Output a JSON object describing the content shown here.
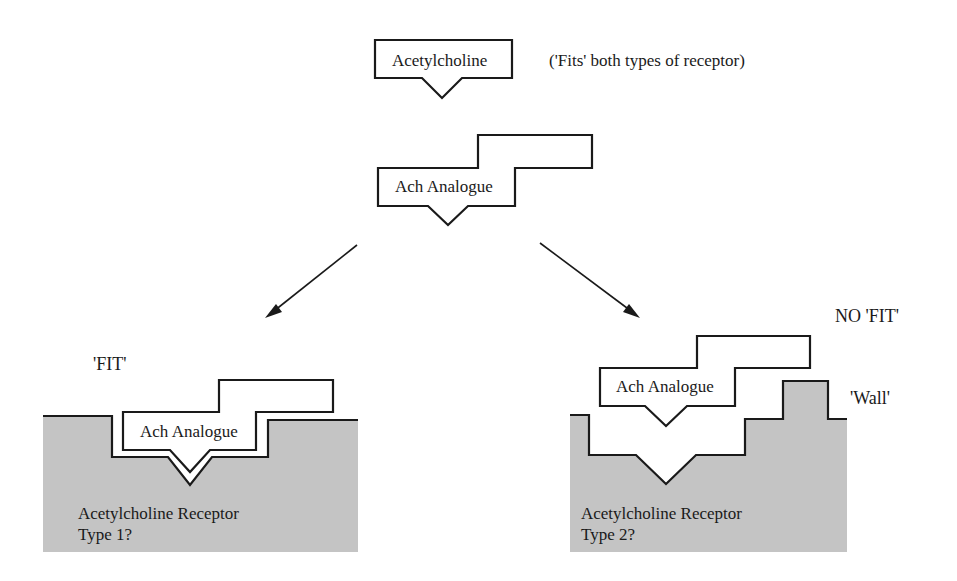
{
  "figure": {
    "top": {
      "molecule_label": "Acetylcholine",
      "note": "('Fits' both types of receptor)",
      "analogue_label": "Ach Analogue"
    },
    "left_panel": {
      "status_label": "'FIT'",
      "analogue_label": "Ach Analogue",
      "receptor_label_line1": "Acetylcholine Receptor",
      "receptor_label_line2": "Type 1?"
    },
    "right_panel": {
      "status_label": "NO 'FIT'",
      "wall_label": "'Wall'",
      "analogue_label": "Ach Analogue",
      "receptor_label_line1": "Acetylcholine Receptor",
      "receptor_label_line2": "Type 2?"
    },
    "colors": {
      "receptor_fill": "#c4c4c4",
      "outline": "#1a1a1a",
      "background": "#ffffff"
    }
  }
}
